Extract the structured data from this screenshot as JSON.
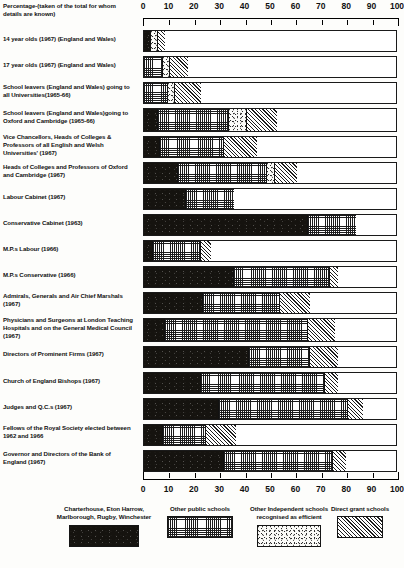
{
  "caption": "Percentage-(taken of the total for whom details are known)",
  "axis": {
    "ticks": [
      0,
      10,
      20,
      30,
      40,
      50,
      60,
      70,
      80,
      90,
      100
    ],
    "min": 0,
    "max": 100
  },
  "legend": [
    {
      "name": "legend-item-top-public-schools",
      "label": "Charterhouse, Eton Harrow, Marlborough, Rugby, Winchester",
      "pattern": "p-solid"
    },
    {
      "name": "legend-item-other-public-schools",
      "label": "Other public schools",
      "pattern": "p-grid"
    },
    {
      "name": "legend-item-other-independent",
      "label": "Other Independent schools recognised as efficient",
      "pattern": "p-dot"
    },
    {
      "name": "legend-item-direct-grant",
      "label": "Direct grant schools",
      "pattern": "p-hatch"
    }
  ],
  "chart_data": {
    "type": "bar",
    "orientation": "horizontal",
    "stacked": true,
    "title": "Percentage-(taken of the total for whom details are known)",
    "xlabel": "",
    "ylabel": "",
    "xlim": [
      0,
      100
    ],
    "grid": false,
    "legend_position": "bottom",
    "series": [
      {
        "name": "Charterhouse, Eton Harrow, Marlborough, Rugby, Winchester",
        "pattern": "p-solid",
        "values": [
          2.5,
          0,
          0,
          5,
          6,
          13,
          16,
          64,
          3,
          35,
          23,
          8,
          41,
          22,
          29,
          7,
          31
        ]
      },
      {
        "name": "Other public schools",
        "pattern": "p-grid",
        "values": [
          0,
          7,
          9,
          28,
          25,
          35,
          19,
          19,
          19,
          38,
          30,
          56,
          24,
          49,
          51,
          17,
          43
        ]
      },
      {
        "name": "Other Independent schools recognised as efficient",
        "pattern": "p-dot",
        "values": [
          2.5,
          3,
          3,
          7,
          0,
          3,
          0,
          0,
          0,
          0,
          0,
          0,
          0,
          0,
          0,
          0,
          0
        ]
      },
      {
        "name": "Direct grant schools",
        "pattern": "p-hatch",
        "values": [
          3,
          7,
          10,
          12,
          13,
          9,
          0,
          0,
          4,
          3,
          12,
          11,
          11,
          5,
          6,
          12,
          5
        ]
      }
    ],
    "categories": [
      "14 year olds (1967) (England and Wales)",
      "17 year olds (1967) (England and Wales)",
      "School leavers (England and Wales) going to all Universities(1965-66)",
      "School leavers (England and Wales) going to Oxford and Cambridge (1965-66)",
      "Vice Chancellors, Heads of Colleges & Professors of all English and Welsh Universities' (1967)",
      "Heads of Colleges and Professors of Oxford and Cambridge (1967)",
      "Labour Cabinet (1967)",
      "Conservative Cabinet (1963)",
      "M.P.s Labour (1966)",
      "M.P.s Conservative (1966)",
      "Admirals, Generals and Air Chief Marshals (1967)",
      "Physicians and Surgeons at London Teaching Hospitals and on the General Medical Council (1967)",
      "Directors of Prominent Firms (1967)",
      "Church of England Bishops (1967)",
      "Judges and Q.C.s (1967)",
      "Fellows of the Royal Society elected between 1962 and 1966",
      "Governor and Directors of the Bank of England (1967)"
    ]
  },
  "rows": [
    {
      "label": "14 year olds (1967) (England and Wales)",
      "segments": [
        {
          "pattern": "p-solid",
          "value": 2.5
        },
        {
          "pattern": "p-dot",
          "value": 2.5
        },
        {
          "pattern": "p-hatch",
          "value": 3
        }
      ]
    },
    {
      "label": "17 year olds (1967) (England and Wales)",
      "segments": [
        {
          "pattern": "p-grid",
          "value": 7
        },
        {
          "pattern": "p-dot",
          "value": 3
        },
        {
          "pattern": "p-hatch",
          "value": 7
        }
      ]
    },
    {
      "label": "School leavers (England and Wales) going to all Universities(1965-66)",
      "segments": [
        {
          "pattern": "p-grid",
          "value": 9
        },
        {
          "pattern": "p-dot",
          "value": 3
        },
        {
          "pattern": "p-hatch",
          "value": 10
        }
      ]
    },
    {
      "label": "School leavers (England and Wales)going to Oxford and Cambridge (1965-66)",
      "segments": [
        {
          "pattern": "p-solid",
          "value": 5
        },
        {
          "pattern": "p-grid",
          "value": 28
        },
        {
          "pattern": "p-dot",
          "value": 7
        },
        {
          "pattern": "p-hatch",
          "value": 12
        }
      ]
    },
    {
      "label": "Vice Chancellors, Heads of Colleges & Professors of all English and Welsh Universities' (1967)",
      "segments": [
        {
          "pattern": "p-solid",
          "value": 6
        },
        {
          "pattern": "p-grid",
          "value": 25
        },
        {
          "pattern": "p-hatch",
          "value": 13
        }
      ]
    },
    {
      "label": "Heads of Colleges and Professors of Oxford and Cambridge (1967)",
      "segments": [
        {
          "pattern": "p-solid",
          "value": 13
        },
        {
          "pattern": "p-grid",
          "value": 35
        },
        {
          "pattern": "p-dot",
          "value": 3
        },
        {
          "pattern": "p-hatch",
          "value": 9
        }
      ]
    },
    {
      "label": "Labour Cabinet (1967)",
      "segments": [
        {
          "pattern": "p-solid",
          "value": 16
        },
        {
          "pattern": "p-grid",
          "value": 19
        }
      ]
    },
    {
      "label": "Conservative Cabinet (1963)",
      "segments": [
        {
          "pattern": "p-solid",
          "value": 64
        },
        {
          "pattern": "p-grid",
          "value": 19
        }
      ]
    },
    {
      "label": "M.P.s Labour (1966)",
      "segments": [
        {
          "pattern": "p-solid",
          "value": 3
        },
        {
          "pattern": "p-grid",
          "value": 19
        },
        {
          "pattern": "p-hatch",
          "value": 4
        }
      ]
    },
    {
      "label": "M.P.s Conservative (1966)",
      "segments": [
        {
          "pattern": "p-solid",
          "value": 35
        },
        {
          "pattern": "p-grid",
          "value": 38
        },
        {
          "pattern": "p-hatch",
          "value": 3
        }
      ]
    },
    {
      "label": "Admirals, Generals and Air Chief Marshals (1967)",
      "segments": [
        {
          "pattern": "p-solid",
          "value": 23
        },
        {
          "pattern": "p-grid",
          "value": 30
        },
        {
          "pattern": "p-hatch",
          "value": 12
        }
      ]
    },
    {
      "label": "Physicians and Surgeons at London Teaching Hospitals and on the General Medical Council (1967)",
      "segments": [
        {
          "pattern": "p-solid",
          "value": 8
        },
        {
          "pattern": "p-grid",
          "value": 56
        },
        {
          "pattern": "p-hatch",
          "value": 11
        }
      ]
    },
    {
      "label": "Directors of Prominent Firms (1967)",
      "segments": [
        {
          "pattern": "p-solid",
          "value": 41
        },
        {
          "pattern": "p-grid",
          "value": 24
        },
        {
          "pattern": "p-hatch",
          "value": 11
        }
      ]
    },
    {
      "label": "Church of England Bishops (1967)",
      "segments": [
        {
          "pattern": "p-solid",
          "value": 22
        },
        {
          "pattern": "p-grid",
          "value": 49
        },
        {
          "pattern": "p-hatch",
          "value": 5
        }
      ]
    },
    {
      "label": "Judges and Q.C.s (1967)",
      "segments": [
        {
          "pattern": "p-solid",
          "value": 29
        },
        {
          "pattern": "p-grid",
          "value": 51
        },
        {
          "pattern": "p-hatch",
          "value": 6
        }
      ]
    },
    {
      "label": "Fellows of the Royal Society elected between 1962 and 1966",
      "segments": [
        {
          "pattern": "p-solid",
          "value": 7
        },
        {
          "pattern": "p-grid",
          "value": 17
        },
        {
          "pattern": "p-hatch",
          "value": 12
        }
      ]
    },
    {
      "label": "Governor and Directors of the Bank of England (1967)",
      "segments": [
        {
          "pattern": "p-solid",
          "value": 31
        },
        {
          "pattern": "p-grid",
          "value": 43
        },
        {
          "pattern": "p-hatch",
          "value": 5
        }
      ]
    }
  ],
  "layout": {
    "rows_geometry": [
      {
        "top": 30,
        "height": 22,
        "label_top": 35
      },
      {
        "top": 56,
        "height": 22,
        "label_top": 61
      },
      {
        "top": 82,
        "height": 22,
        "label_top": 83
      },
      {
        "top": 108,
        "height": 24,
        "label_top": 109
      },
      {
        "top": 136,
        "height": 22,
        "label_top": 133
      },
      {
        "top": 162,
        "height": 22,
        "label_top": 163
      },
      {
        "top": 188,
        "height": 22,
        "label_top": 193
      },
      {
        "top": 214,
        "height": 22,
        "label_top": 219
      },
      {
        "top": 240,
        "height": 22,
        "label_top": 245
      },
      {
        "top": 266,
        "height": 22,
        "label_top": 271
      },
      {
        "top": 292,
        "height": 22,
        "label_top": 292
      },
      {
        "top": 318,
        "height": 24,
        "label_top": 316
      },
      {
        "top": 346,
        "height": 22,
        "label_top": 350
      },
      {
        "top": 372,
        "height": 22,
        "label_top": 377
      },
      {
        "top": 398,
        "height": 22,
        "label_top": 403
      },
      {
        "top": 424,
        "height": 22,
        "label_top": 424
      },
      {
        "top": 450,
        "height": 22,
        "label_top": 450
      }
    ],
    "legend_geometry": [
      {
        "left": 50,
        "width": 108
      },
      {
        "left": 148,
        "width": 104
      },
      {
        "left": 238,
        "width": 102
      },
      {
        "left": 318,
        "width": 84
      }
    ]
  }
}
